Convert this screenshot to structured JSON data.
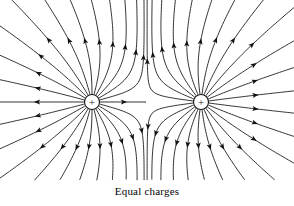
{
  "figure": {
    "caption": "Equal charges",
    "background_color": "#ffffff",
    "line_color": "#111111",
    "charge_symbol": "+",
    "charge_label_left": "+",
    "charge_label_right": "+"
  },
  "chart_data": {
    "type": "diagram",
    "title": "Equal charges",
    "subtitle": "",
    "width": 294,
    "height": 206,
    "xlabel": "",
    "ylabel": "",
    "grid": false,
    "legend": "none",
    "charges": [
      {
        "id": "left-charge",
        "sign": "+",
        "label": "+",
        "magnitude": 1,
        "cx": 92,
        "cy": 102,
        "radius": 7.5,
        "line_count": 24
      },
      {
        "id": "right-charge",
        "sign": "+",
        "label": "+",
        "magnitude": 1,
        "cx": 201,
        "cy": 102,
        "radius": 7.5,
        "line_count": 24
      }
    ],
    "field_lines": {
      "total": 48,
      "per_charge": 24,
      "direction": "outward",
      "arrowheads_per_line": 1,
      "start_radius": 8,
      "angular_step_degrees": 15
    },
    "neutral_point": {
      "x": 146.5,
      "y": 102
    },
    "annotations": [
      {
        "text": "Equal charges",
        "x": 147,
        "y": 194,
        "role": "caption"
      }
    ]
  }
}
